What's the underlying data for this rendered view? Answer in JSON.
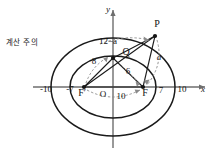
{
  "annotation": {
    "memo_text": "계산 주의"
  },
  "figure": {
    "axes": {
      "x_label": "x",
      "y_label": "y",
      "origin_label": "O",
      "x_ticks_left": [
        "-10",
        "-7"
      ],
      "x_ticks_right": [
        "7",
        "10"
      ]
    },
    "points": {
      "p_label": "P",
      "q_label": "Q",
      "focus_right_label": "F",
      "focus_left_label": "F′"
    },
    "segments": {
      "seg_8": "8",
      "seg_6": "6",
      "seg_10": "10",
      "seg_12_minus_a": "12−a",
      "seg_a": "a"
    },
    "colors": {
      "curve": "#1a1a1a",
      "axis": "#6e6e6e",
      "dashed": "#8a8a8a",
      "text": "#141414"
    }
  }
}
